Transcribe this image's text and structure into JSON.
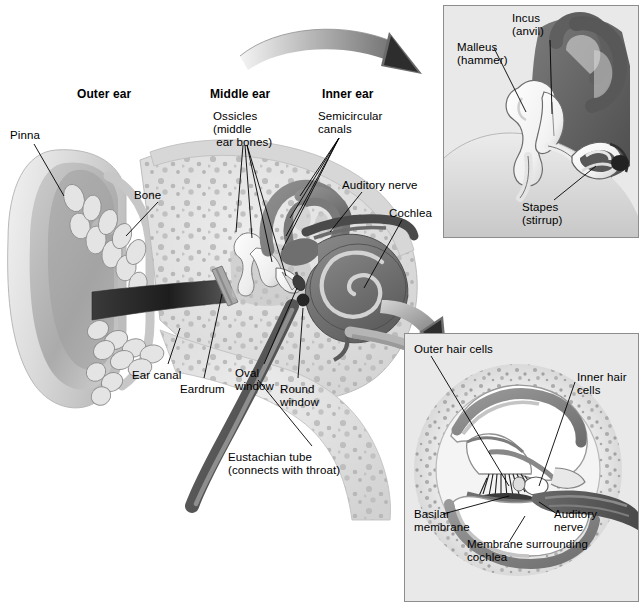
{
  "figure": {
    "type": "anatomical-diagram",
    "background_color": "#ffffff",
    "ink_color": "#000000",
    "inset_background": "#e9e9e9",
    "inset_border": "#8d8d8d"
  },
  "main": {
    "section_headings": [
      {
        "text": "Outer ear",
        "x": 77,
        "y": 88
      },
      {
        "text": "Middle ear",
        "x": 210,
        "y": 88
      },
      {
        "text": "Inner ear",
        "x": 322,
        "y": 88
      }
    ],
    "labels": [
      {
        "id": "pinna",
        "text": "Pinna",
        "x": 10,
        "y": 129
      },
      {
        "id": "bone",
        "text": "Bone",
        "x": 134,
        "y": 189
      },
      {
        "id": "ossicles",
        "text": "Ossicles\n(middle\n ear bones)",
        "x": 213,
        "y": 110
      },
      {
        "id": "semicircular",
        "text": "Semicircular\ncanals",
        "x": 318,
        "y": 110
      },
      {
        "id": "auditory-nerve",
        "text": "Auditory nerve",
        "x": 342,
        "y": 179
      },
      {
        "id": "cochlea",
        "text": "Cochlea",
        "x": 389,
        "y": 207
      },
      {
        "id": "ear-canal",
        "text": "Ear canal",
        "x": 132,
        "y": 369
      },
      {
        "id": "eardrum",
        "text": "Eardrum",
        "x": 180,
        "y": 383
      },
      {
        "id": "oval-window",
        "text": "Oval\nwindow",
        "x": 235,
        "y": 367
      },
      {
        "id": "round-window",
        "text": "Round\nwindow",
        "x": 280,
        "y": 383
      },
      {
        "id": "eustachian-tube",
        "text": "Eustachian tube\n(connects with throat)",
        "x": 228,
        "y": 451
      }
    ]
  },
  "inset_ossicles": {
    "name": "middle-ear-ossicles-detail",
    "x": 443,
    "y": 5,
    "width": 196,
    "height": 233,
    "labels": [
      {
        "id": "malleus",
        "text": "Malleus\n(hammer)",
        "x": 457,
        "y": 41
      },
      {
        "id": "incus",
        "text": "Incus\n(anvil)",
        "x": 512,
        "y": 12
      },
      {
        "id": "stapes",
        "text": "Stapes\n(stirrup)",
        "x": 522,
        "y": 201
      }
    ]
  },
  "inset_cochlea": {
    "name": "cochlea-cross-section-detail",
    "x": 404,
    "y": 333,
    "width": 235,
    "height": 269,
    "labels": [
      {
        "id": "outer-hair-cells",
        "text": "Outer hair cells",
        "x": 414,
        "y": 343
      },
      {
        "id": "inner-hair-cells",
        "text": "Inner hair\ncells",
        "x": 577,
        "y": 371
      },
      {
        "id": "basilar-membrane",
        "text": "Basilar\nmembrane",
        "x": 414,
        "y": 508
      },
      {
        "id": "auditory-nerve-2",
        "text": "Auditory\nnerve",
        "x": 554,
        "y": 508
      },
      {
        "id": "membrane-cochlea",
        "text": "Membrane surrounding\ncochlea",
        "x": 467,
        "y": 538
      }
    ]
  },
  "arrows": [
    {
      "id": "arrow-to-ossicles-inset",
      "from": "middle-ear",
      "to": "inset_ossicles"
    },
    {
      "id": "arrow-to-cochlea-inset",
      "from": "cochlea",
      "to": "inset_cochlea"
    }
  ]
}
